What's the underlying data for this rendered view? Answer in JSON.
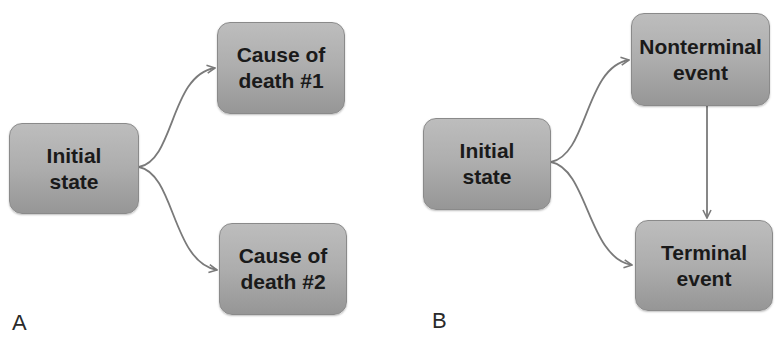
{
  "panels": [
    {
      "label": "A",
      "nodes": {
        "initial": "Initial\nstate",
        "cause1": "Cause of\ndeath #1",
        "cause2": "Cause of\ndeath #2"
      },
      "edges": [
        {
          "from": "initial",
          "to": "cause1"
        },
        {
          "from": "initial",
          "to": "cause2"
        }
      ]
    },
    {
      "label": "B",
      "nodes": {
        "initial": "Initial\nstate",
        "nonterminal": "Nonterminal\nevent",
        "terminal": "Terminal\nevent"
      },
      "edges": [
        {
          "from": "initial",
          "to": "nonterminal"
        },
        {
          "from": "initial",
          "to": "terminal"
        },
        {
          "from": "nonterminal",
          "to": "terminal"
        }
      ]
    }
  ],
  "colors": {
    "node_fill_top": "#bdbdbd",
    "node_fill_bottom": "#969696",
    "edge": "#7a7a7a",
    "text": "#1a1a1a"
  }
}
